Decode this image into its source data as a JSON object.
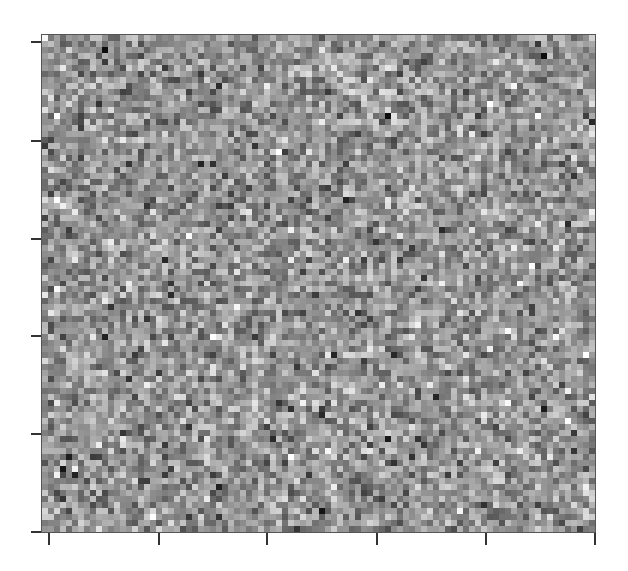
{
  "chart_data": {
    "type": "heatmap",
    "title": "",
    "xlabel": "",
    "ylabel": "",
    "colormap": "grayscale",
    "grid": false,
    "legend": null,
    "grid_size": {
      "cols": 92,
      "rows": 83
    },
    "value_range": [
      0,
      1
    ],
    "distribution": "random noise, mostly mid-gray (~0.55) with std ~0.15",
    "seed": 12345,
    "x_ticks": {
      "count": 6,
      "labels": [
        "",
        "",
        "",
        "",
        "",
        ""
      ],
      "pixel_positions": [
        48,
        158,
        266,
        376,
        485,
        594
      ]
    },
    "y_ticks": {
      "count": 6,
      "labels": [
        "",
        "",
        "",
        "",
        "",
        ""
      ],
      "pixel_positions": [
        41,
        140,
        238,
        335,
        433,
        531
      ]
    }
  },
  "colors": {
    "frame": "#555555",
    "tick": "#333333",
    "background": "#ffffff"
  }
}
